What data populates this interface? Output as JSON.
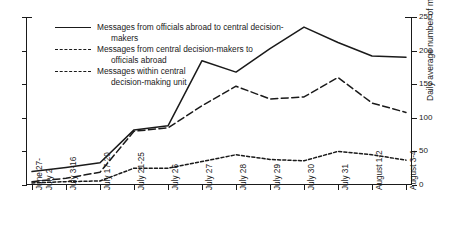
{
  "chart_data": {
    "type": "line",
    "title": "",
    "xlabel": "",
    "ylabel": "Daily average number of messages",
    "ylim": [
      0,
      250
    ],
    "yticks": [
      0,
      50,
      100,
      150,
      200,
      250
    ],
    "grid": false,
    "legend_position": "inside-top-left",
    "categories": [
      "June 27-July 2",
      "July 3-16",
      "July 17-20",
      "July 21-25",
      "July 26",
      "July 27",
      "July 28",
      "July 29",
      "July 30",
      "July 31",
      "August 1-2",
      "August 3-4"
    ],
    "series": [
      {
        "name": "Messages from officials abroad to central decision-makers",
        "style": "solid",
        "values": [
          20,
          26,
          33,
          82,
          88,
          185,
          168,
          203,
          235,
          212,
          192,
          190
        ]
      },
      {
        "name": "Messages from central decision-makers to officials abroad",
        "style": "dashed",
        "values": [
          5,
          10,
          19,
          80,
          85,
          118,
          147,
          128,
          131,
          160,
          122,
          108
        ]
      },
      {
        "name": "Messages within central decision-making unit",
        "style": "dotted",
        "values": [
          3,
          5,
          6,
          25,
          25,
          35,
          45,
          38,
          36,
          50,
          45,
          37
        ]
      }
    ]
  },
  "axis": {
    "y_title": "Daily average number of messages",
    "y_tick_labels": [
      "0",
      "50",
      "100",
      "150",
      "200",
      "250"
    ],
    "x_tick_labels": [
      [
        "June 27-",
        "July 2"
      ],
      [
        "July 3-16"
      ],
      [
        "July 17-20"
      ],
      [
        "July 21-25"
      ],
      [
        "July 26"
      ],
      [
        "July 27"
      ],
      [
        "July 28"
      ],
      [
        "July 29"
      ],
      [
        "July 30"
      ],
      [
        "July 31"
      ],
      [
        "August 1-2"
      ],
      [
        "August 3-4"
      ]
    ]
  },
  "legend": {
    "entries": [
      {
        "line1": "Messages from officials abroad to central decision-",
        "line2": "makers",
        "style": "solid"
      },
      {
        "line1": "Messages from central decision-makers to",
        "line2": "officials abroad",
        "style": "dashed"
      },
      {
        "line1": "Messages within central",
        "line2": "decision-making unit",
        "style": "dotted"
      }
    ]
  },
  "colors": {
    "line": "#1a1a1a",
    "background": "#ffffff"
  }
}
